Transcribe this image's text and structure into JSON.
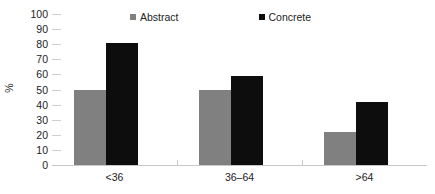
{
  "chart_data": {
    "type": "bar",
    "title": "",
    "subtitle": "",
    "xlabel": "",
    "ylabel": "%",
    "categories": [
      "<36",
      "36–64",
      ">64"
    ],
    "series": [
      {
        "name": "Abstract",
        "values": [
          50,
          50,
          22
        ],
        "color": "#808080"
      },
      {
        "name": "Concrete",
        "values": [
          81,
          59,
          42
        ],
        "color": "#0d0d0d"
      }
    ],
    "ylim": [
      0,
      100
    ],
    "ytick_step": 10,
    "yticks": [
      0,
      10,
      20,
      30,
      40,
      50,
      60,
      70,
      80,
      90,
      100
    ],
    "ytick_labels": [
      "0",
      "10",
      "20",
      "30",
      "40",
      "50",
      "60",
      "70",
      "80",
      "90",
      "100"
    ],
    "grid": false,
    "legend_position": "top",
    "axis_color": "#c8c8c8",
    "tick_color": "#cfcfcf",
    "background": "#ffffff",
    "text_color": "#222222"
  },
  "legend": {
    "entries": [
      {
        "label": "Abstract",
        "swatch": "legend-swatch-abstract"
      },
      {
        "label": "Concrete",
        "swatch": "legend-swatch-concrete"
      }
    ]
  }
}
